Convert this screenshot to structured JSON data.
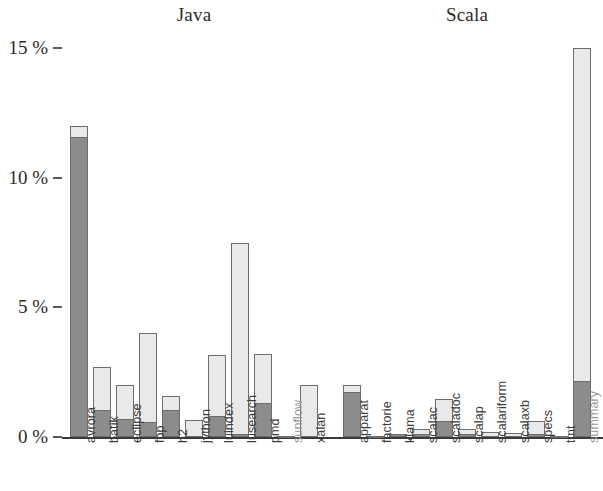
{
  "chart_data": {
    "type": "bar",
    "title": "",
    "subtitle": "",
    "xlabel": "",
    "ylabel": "",
    "ylim": [
      0,
      15
    ],
    "ytick_values": [
      0,
      5,
      10,
      15
    ],
    "ytick_labels": [
      "0 %",
      "5 %",
      "10 %",
      "15 %"
    ],
    "grid": false,
    "legend_position": "none",
    "stacked": true,
    "group_titles": [
      "Java",
      "Scala"
    ],
    "series": [
      {
        "name": "dark-segment",
        "color": "#8c8c8c",
        "values": [
          11.5,
          0.95,
          0.6,
          0.5,
          0.95,
          0.0,
          0.75,
          0.05,
          1.25,
          0.0,
          0.0,
          1.65,
          0.0,
          0.05,
          0.05,
          0.55,
          0.05,
          0.0,
          0.0,
          0.05,
          0.0,
          2.1
        ]
      },
      {
        "name": "light-segment",
        "color": "#e9e9e9",
        "values": [
          0.5,
          1.75,
          1.4,
          3.5,
          0.65,
          0.65,
          2.4,
          7.45,
          1.95,
          0.05,
          2.0,
          0.35,
          0.05,
          0.07,
          0.25,
          0.9,
          0.25,
          0.2,
          0.15,
          0.55,
          0.05,
          12.9
        ]
      }
    ],
    "totals": [
      12.0,
      2.7,
      2.0,
      4.0,
      1.6,
      0.65,
      3.15,
      7.5,
      3.2,
      0.05,
      2.0,
      2.0,
      0.05,
      0.12,
      0.3,
      1.45,
      0.3,
      0.2,
      0.15,
      0.6,
      0.05,
      15.0
    ],
    "categories": [
      "avrora",
      "batik",
      "eclipse",
      "fop",
      "h2",
      "jython",
      "luindex",
      "lusearch",
      "pmd",
      "sunflow",
      "xalan",
      "apparat",
      "factorie",
      "kiama",
      "scalac",
      "scaladoc",
      "scalap",
      "scalariform",
      "scalaxb",
      "specs",
      "tmt",
      "summary"
    ],
    "groups": [
      {
        "name": "Java",
        "start_index": 0,
        "end_index": 10
      },
      {
        "name": "Scala",
        "start_index": 11,
        "end_index": 21
      }
    ]
  },
  "axis": {
    "baseline_color": "#3a3a3a",
    "tick_color": "#5a5a5a"
  },
  "colors": {
    "background": "#ffffff",
    "light_fill": "#e9e9e9",
    "dark_fill": "#8c8c8c",
    "bar_outline": "#6d6d6d",
    "text": "#2b2b2b"
  }
}
